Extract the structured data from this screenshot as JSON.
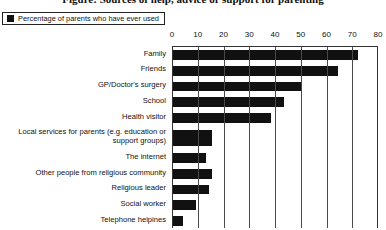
{
  "title": "Figure: Sources of help, advice or support for parenting",
  "legend": {
    "label": "Percentage of parents who have ever used",
    "swatch_color": "#111111",
    "swatch_name": "legend-swatch-percentage"
  },
  "axis": {
    "ticks": [
      "0",
      "10",
      "20",
      "30",
      "40",
      "50",
      "60",
      "70",
      "80"
    ]
  },
  "chart_data": {
    "type": "bar",
    "orientation": "horizontal",
    "title": "Figure: Sources of help, advice or support for parenting",
    "xlabel": "",
    "ylabel": "",
    "xlim": [
      0,
      80
    ],
    "grid": true,
    "legend_position": "top-left",
    "series": [
      {
        "name": "Percentage of parents who have ever used",
        "color": "#111111",
        "values": [
          72,
          64,
          50,
          43,
          38,
          15,
          13,
          15,
          14,
          9,
          4
        ]
      }
    ],
    "categories": [
      "Family",
      "Friends",
      "GP/Doctor's surgery",
      "School",
      "Health visitor",
      "Local services for parents (e.g. education or support groups)",
      "The internet",
      "Other people from religious community",
      "Religious leader",
      "Social worker",
      "Telephone helpines"
    ],
    "category_lines": [
      [
        "Family"
      ],
      [
        "Friends"
      ],
      [
        "GP/Doctor's surgery"
      ],
      [
        "School"
      ],
      [
        "Health visitor"
      ],
      [
        "Local services for parents (e.g. education or",
        "support groups)"
      ],
      [
        "The internet"
      ],
      [
        "Other people from religious community"
      ],
      [
        "Religious leader"
      ],
      [
        "Social worker"
      ],
      [
        "Telephone helpines"
      ]
    ]
  }
}
